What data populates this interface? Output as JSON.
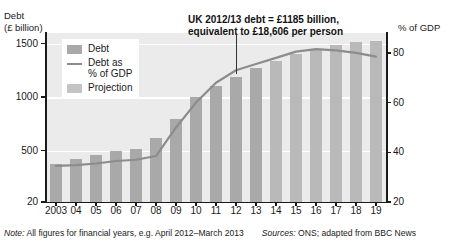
{
  "axes": {
    "left_title": "Debt\n(£ billion)",
    "right_title": "% of GDP",
    "left_ticks": [
      "1500",
      "1000",
      "500",
      "20"
    ],
    "right_ticks": [
      "80",
      "60",
      "40",
      "20"
    ],
    "x_ticks": [
      "2003",
      "04",
      "05",
      "06",
      "07",
      "08",
      "09",
      "10",
      "11",
      "12",
      "13",
      "14",
      "15",
      "16",
      "17",
      "18",
      "19"
    ]
  },
  "legend": {
    "items": [
      {
        "label": "Debt",
        "type": "swatch",
        "color": "#a9a9a9"
      },
      {
        "label": "Debt as\n% of GDP",
        "type": "line",
        "color": "#8c8c8c"
      },
      {
        "label": "Projection",
        "type": "swatch",
        "color": "#c4c4c4"
      }
    ]
  },
  "annotation": {
    "text": "UK 2012/13 debt = £1185 billion,\nequivalent to £18,606 per person"
  },
  "footnote": {
    "note_label": "Note:",
    "note_text": " All figures for financial years, e.g. April 2012–March 2013",
    "sources_label": "Sources:",
    "sources_text": " ONS; adapted from BBC News"
  },
  "chart_data": {
    "type": "bar",
    "title": "",
    "xlabel": "",
    "ylabel": "Debt (£ billion)",
    "y2label": "% of GDP",
    "grid": true,
    "legend_position": "top-left",
    "categories": [
      "2003",
      "04",
      "05",
      "06",
      "07",
      "08",
      "09",
      "10",
      "11",
      "12",
      "13",
      "14",
      "15",
      "16",
      "17",
      "18",
      "19"
    ],
    "ylim": [
      20,
      1600
    ],
    "y2lim": [
      20,
      88
    ],
    "series": [
      {
        "name": "Debt",
        "type": "bar",
        "axis": "left",
        "color": "#a9a9a9",
        "values": [
          380,
          420,
          460,
          495,
          520,
          620,
          800,
          1000,
          1100,
          1185,
          1270,
          1340,
          1400,
          1450,
          1490,
          1520,
          1530
        ],
        "projection_from_index": 11
      },
      {
        "name": "Debt as % of GDP",
        "type": "line",
        "axis": "right",
        "color": "#8c8c8c",
        "values": [
          34.5,
          34.8,
          35.5,
          36.5,
          37.0,
          38.5,
          50.0,
          60.0,
          68.0,
          73.0,
          75.5,
          78.0,
          80.5,
          81.5,
          81.0,
          80.0,
          78.5
        ]
      }
    ]
  }
}
